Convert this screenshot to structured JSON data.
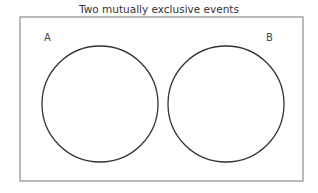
{
  "diagram": {
    "title": "Two mutually exclusive events",
    "type": "venn",
    "sets": [
      {
        "label": "A",
        "cx": 100,
        "cy": 104,
        "r": 58
      },
      {
        "label": "B",
        "cx": 226,
        "cy": 104,
        "r": 58
      }
    ],
    "overlap": false,
    "colors": {
      "stroke": "#333333",
      "frame": "#777777",
      "background": "#ffffff"
    }
  }
}
